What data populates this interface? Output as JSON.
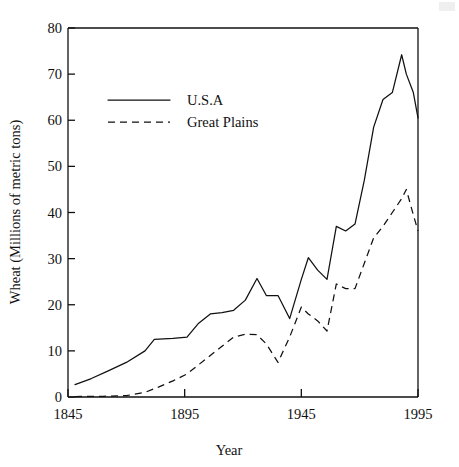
{
  "chart_data": {
    "type": "line",
    "title": "",
    "xlabel": "Year",
    "ylabel": "Wheat (Millions of metric tons)",
    "xlim": [
      1845,
      1995
    ],
    "ylim": [
      0,
      80
    ],
    "xticks": [
      1845,
      1895,
      1945,
      1995
    ],
    "yticks": [
      0,
      10,
      20,
      30,
      40,
      50,
      60,
      70,
      80
    ],
    "grid": false,
    "legend_position": "upper-left-inside",
    "series": [
      {
        "name": "U.S.A",
        "style": "solid",
        "color": "#111111",
        "x": [
          1848,
          1855,
          1862,
          1870,
          1878,
          1882,
          1890,
          1896,
          1901,
          1906,
          1911,
          1916,
          1921,
          1926,
          1930,
          1935,
          1940,
          1945,
          1948,
          1952,
          1956,
          1960,
          1964,
          1968,
          1972,
          1976,
          1980,
          1984,
          1988,
          1990,
          1993,
          1995
        ],
        "y": [
          2.7,
          4.0,
          5.6,
          7.5,
          10.0,
          12.5,
          12.7,
          13.0,
          16.0,
          18.0,
          18.3,
          18.8,
          21.0,
          25.7,
          22.0,
          22.0,
          17.0,
          25.5,
          30.2,
          27.5,
          25.5,
          37.0,
          36.0,
          37.5,
          47.0,
          58.5,
          64.5,
          66.0,
          74.2,
          70.0,
          66.0,
          60.5
        ]
      },
      {
        "name": "Great Plains",
        "style": "dashed",
        "color": "#111111",
        "x": [
          1848,
          1860,
          1870,
          1878,
          1884,
          1890,
          1896,
          1901,
          1906,
          1911,
          1916,
          1921,
          1926,
          1930,
          1935,
          1940,
          1945,
          1948,
          1952,
          1956,
          1960,
          1964,
          1968,
          1972,
          1976,
          1980,
          1984,
          1988,
          1990,
          1993,
          1995
        ],
        "y": [
          0.1,
          0.15,
          0.3,
          1.0,
          2.2,
          3.5,
          5.0,
          7.0,
          9.0,
          11.0,
          13.0,
          13.6,
          13.5,
          11.5,
          7.5,
          13.0,
          19.5,
          18.0,
          16.5,
          14.3,
          24.5,
          23.5,
          23.5,
          29.0,
          34.5,
          37.0,
          40.0,
          43.0,
          45.0,
          39.5,
          36.0
        ]
      }
    ],
    "annotations": []
  },
  "legend": {
    "entries": [
      {
        "label": "U.S.A",
        "style": "solid"
      },
      {
        "label": "Great Plains",
        "style": "dashed"
      }
    ]
  }
}
